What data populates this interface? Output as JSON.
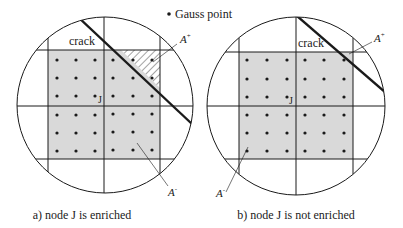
{
  "legend": {
    "marker": "•",
    "label": "Gauss point"
  },
  "panels": [
    {
      "id": "a",
      "caption": "a) node J is enriched",
      "crack_label": "crack",
      "node_label": "J",
      "area_plus_label": "A",
      "area_plus_sup": "+",
      "area_minus_label": "A",
      "area_minus_sup": "-",
      "node_enriched": true
    },
    {
      "id": "b",
      "caption": "b) node J is not enriched",
      "crack_label": "crack",
      "node_label": "J",
      "area_plus_label": "A",
      "area_plus_sup": "+",
      "area_minus_label": "A",
      "area_minus_sup": "-",
      "node_enriched": false
    }
  ],
  "colors": {
    "shaded_area": "#d9d9d9",
    "lines": "#1a1a1a",
    "background": "#ffffff"
  }
}
